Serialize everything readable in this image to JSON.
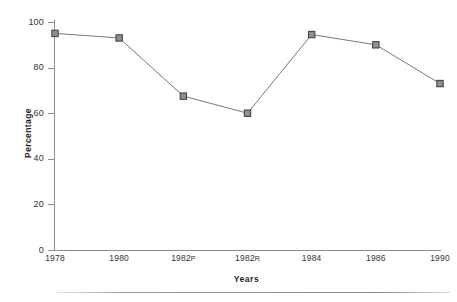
{
  "chart_data": {
    "type": "line",
    "title": "",
    "xlabel": "Years",
    "ylabel": "Percentage",
    "categories": [
      "1978",
      "1980",
      "1982P",
      "1982R",
      "1984",
      "1986",
      "1990"
    ],
    "category_parts": [
      {
        "year": "1978",
        "suffix": ""
      },
      {
        "year": "1980",
        "suffix": ""
      },
      {
        "year": "1982",
        "suffix": "P"
      },
      {
        "year": "1982",
        "suffix": "R"
      },
      {
        "year": "1984",
        "suffix": ""
      },
      {
        "year": "1986",
        "suffix": ""
      },
      {
        "year": "1990",
        "suffix": ""
      }
    ],
    "values": [
      95,
      93,
      67.5,
      60,
      94.5,
      90,
      73
    ],
    "ylim": [
      0,
      100
    ],
    "yticks": [
      0,
      20,
      40,
      60,
      80,
      100
    ],
    "ytick_labels": [
      "0",
      "20",
      "40",
      "60",
      "80",
      "100"
    ],
    "grid": false,
    "legend": false,
    "legend_position": "none",
    "series": [
      {
        "name": "Percentage",
        "values": [
          95,
          93,
          67.5,
          60,
          94.5,
          90,
          73
        ],
        "line_color": "#787878",
        "marker_fill": "#8f8f8f",
        "marker_edge": "#3b3b3b",
        "marker_shape": "square"
      }
    ]
  },
  "colors": {
    "background": "#ffffff",
    "axis": "#8d8d8d",
    "text": "#333333",
    "title_text": "#1e1e1e",
    "line": "#787878",
    "marker_fill": "#8f8f8f",
    "marker_edge": "#3b3b3b",
    "page_rule": "#8a8a8a"
  }
}
